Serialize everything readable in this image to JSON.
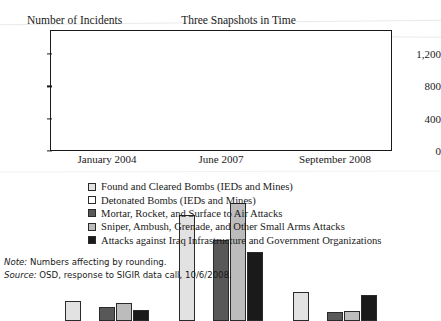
{
  "header": {
    "y_axis_caption": "Number of Incidents",
    "title": "Three Snapshots in Time"
  },
  "chart_data": {
    "type": "bar",
    "title": "Three Snapshots in Time",
    "xlabel": "",
    "ylabel": "Number of Incidents",
    "ylim": [
      0,
      1500
    ],
    "yticks": [
      "0",
      "400",
      "800",
      "1,200"
    ],
    "ytick_values": [
      0,
      400,
      800,
      1200
    ],
    "grid": false,
    "legend_position": "below",
    "categories": [
      "January 2004",
      "June 2007",
      "September 2008"
    ],
    "series": [
      {
        "name": "Found and Cleared Bombs (IEDs and Mines)",
        "color": "#e2e2e2",
        "values": [
          250,
          1320,
          355
        ]
      },
      {
        "name": "Detonated Bombs (IEDs and Mines)",
        "color": "#ffffff",
        "values": [
          0,
          0,
          0
        ]
      },
      {
        "name": "Mortar, Rocket, and Surface to Air Attacks",
        "color": "#585858",
        "values": [
          170,
          1010,
          110
        ]
      },
      {
        "name": "Sniper, Ambush, Grenade, and Other Small Arms Attacks",
        "color": "#bcbcbc",
        "values": [
          220,
          1460,
          125
        ]
      },
      {
        "name": "Attacks against Iraq Infrastructure and Government Organizations",
        "color": "#1a1a1a",
        "values": [
          135,
          860,
          320
        ]
      }
    ]
  },
  "legend": {
    "items": [
      {
        "label": "Found and Cleared Bombs (IEDs and Mines)",
        "color": "#e2e2e2"
      },
      {
        "label": "Detonated Bombs (IEDs and Mines)",
        "color": "#ffffff"
      },
      {
        "label": "Mortar, Rocket, and Surface to Air Attacks",
        "color": "#585858"
      },
      {
        "label": "Sniper, Ambush, Grenade, and Other Small Arms Attacks",
        "color": "#bcbcbc"
      },
      {
        "label": "Attacks against Iraq Infrastructure and Government Organizations",
        "color": "#1a1a1a"
      }
    ]
  },
  "footnotes": {
    "note_label": "Note:",
    "note_text": " Numbers affecting by rounding.",
    "source_label": "Source:",
    "source_text": " OSD, response to SIGIR data call, 10/6/2008."
  }
}
